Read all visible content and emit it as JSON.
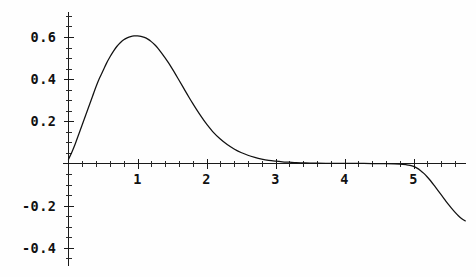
{
  "chart_data": {
    "type": "line",
    "title": "",
    "subtitle": "",
    "xlabel": "",
    "ylabel": "",
    "xlim": [
      -0.08,
      5.82
    ],
    "ylim": [
      -0.47,
      0.72
    ],
    "grid": false,
    "legend": null,
    "background_color": "#fefefe",
    "curve_color": "#111111",
    "axis_color": "#1a1a1a",
    "x_ticks_major": [
      1,
      2,
      3,
      4,
      5
    ],
    "x_tick_labels": [
      "1",
      "2",
      "3",
      "4",
      "5"
    ],
    "x_ticks_minor": [
      0.2,
      0.4,
      0.6,
      0.8,
      1.2,
      1.4,
      1.6,
      1.8,
      2.2,
      2.4,
      2.6,
      2.8,
      3.2,
      3.4,
      3.6,
      3.8,
      4.2,
      4.4,
      4.6,
      4.8,
      5.2,
      5.4,
      5.6
    ],
    "y_ticks_major": [
      -0.4,
      -0.2,
      0.2,
      0.4,
      0.6
    ],
    "y_tick_labels": [
      "-0.4",
      "-0.2",
      "0.2",
      "0.4",
      "0.6"
    ],
    "y_ticks_minor": [
      -0.45,
      -0.35,
      -0.3,
      -0.25,
      -0.15,
      -0.1,
      -0.05,
      0.05,
      0.1,
      0.15,
      0.25,
      0.3,
      0.35,
      0.45,
      0.5,
      0.55,
      0.65,
      0.7
    ],
    "series": [
      {
        "name": "curve",
        "x": [
          0.0,
          0.05,
          0.1,
          0.15,
          0.2,
          0.25,
          0.3,
          0.35,
          0.4,
          0.45,
          0.5,
          0.55,
          0.6,
          0.65,
          0.7,
          0.75,
          0.8,
          0.85,
          0.9,
          0.95,
          1.0,
          1.05,
          1.1,
          1.15,
          1.2,
          1.25,
          1.3,
          1.35,
          1.4,
          1.45,
          1.5,
          1.55,
          1.6,
          1.65,
          1.7,
          1.75,
          1.8,
          1.85,
          1.9,
          1.95,
          2.0,
          2.1,
          2.2,
          2.3,
          2.4,
          2.5,
          2.6,
          2.7,
          2.8,
          2.9,
          3.0,
          3.1,
          3.2,
          3.3,
          3.4,
          3.5,
          3.6,
          3.8,
          4.0,
          4.2,
          4.4,
          4.6,
          4.8,
          4.9,
          4.95,
          5.0,
          5.05,
          5.1,
          5.15,
          5.2,
          5.25,
          5.3,
          5.35,
          5.4,
          5.45,
          5.5,
          5.55,
          5.6,
          5.65,
          5.7,
          5.75
        ],
        "y": [
          0.02,
          0.055,
          0.095,
          0.14,
          0.185,
          0.23,
          0.275,
          0.32,
          0.365,
          0.405,
          0.44,
          0.475,
          0.505,
          0.532,
          0.555,
          0.573,
          0.587,
          0.596,
          0.602,
          0.605,
          0.605,
          0.603,
          0.598,
          0.59,
          0.578,
          0.563,
          0.545,
          0.524,
          0.501,
          0.477,
          0.451,
          0.424,
          0.396,
          0.368,
          0.34,
          0.312,
          0.285,
          0.259,
          0.234,
          0.21,
          0.188,
          0.148,
          0.116,
          0.09,
          0.069,
          0.052,
          0.039,
          0.029,
          0.021,
          0.015,
          0.011,
          0.008,
          0.006,
          0.004,
          0.003,
          0.002,
          0.0015,
          0.001,
          0.0005,
          0.0002,
          0.0,
          -0.001,
          -0.003,
          -0.006,
          -0.009,
          -0.014,
          -0.022,
          -0.033,
          -0.047,
          -0.064,
          -0.083,
          -0.104,
          -0.126,
          -0.148,
          -0.17,
          -0.192,
          -0.212,
          -0.231,
          -0.248,
          -0.262,
          -0.272
        ]
      }
    ]
  },
  "axes": {
    "x_axis_name": "horizontal-axis",
    "y_axis_name": "vertical-axis"
  }
}
